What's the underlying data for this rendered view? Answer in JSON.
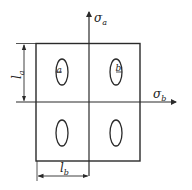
{
  "diagram": {
    "type": "stress-field schematic",
    "stroke_color": "#2a2a2a",
    "background": "#ffffff",
    "axes": {
      "vertical": {
        "label": "σ",
        "subscript": "a"
      },
      "horizontal": {
        "label": "σ",
        "subscript": "b"
      }
    },
    "dimensions": {
      "height": {
        "label": "l",
        "subscript": "a"
      },
      "width": {
        "label": "l",
        "subscript": "b"
      }
    },
    "cells": [
      {
        "position": "top-left",
        "ellipse_label": "a"
      },
      {
        "position": "top-right",
        "ellipse_label": "b"
      },
      {
        "position": "bottom-left",
        "ellipse_label": ""
      },
      {
        "position": "bottom-right",
        "ellipse_label": ""
      }
    ]
  }
}
